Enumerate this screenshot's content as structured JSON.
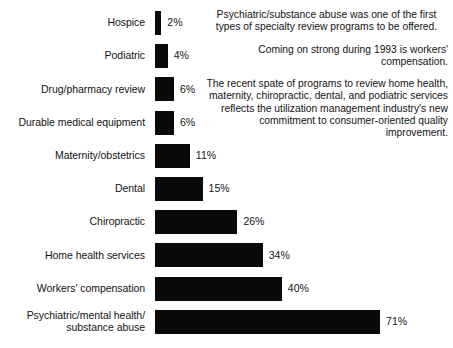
{
  "chart_data": {
    "type": "bar",
    "orientation": "horizontal",
    "title": "",
    "xlabel": "",
    "ylabel": "",
    "grid": false,
    "legend": false,
    "xlim": [
      0,
      71
    ],
    "value_suffix": "%",
    "bar_color": "#0a0a0a",
    "categories": [
      "Hospice",
      "Podiatric",
      "Drug/pharmacy review",
      "Durable medical equipment",
      "Maternity/obstetrics",
      "Dental",
      "Chiropractic",
      "Home health services",
      "Workers' compensation",
      "Psychiatric/mental health/\nsubstance abuse"
    ],
    "values": [
      2,
      4,
      6,
      6,
      11,
      15,
      26,
      34,
      40,
      71
    ],
    "value_labels": [
      "2%",
      "4%",
      "6%",
      "6%",
      "11%",
      "15%",
      "26%",
      "34%",
      "40%",
      "71%"
    ]
  },
  "notes": [
    {
      "id": "note-psychiatric-first",
      "align": "center",
      "text": "Psychiatric/substance abuse was one of the first types of specialty review programs to be offered."
    },
    {
      "id": "note-workers-comp",
      "align": "right",
      "text": "Coming on strong during 1993 is workers' compensation."
    },
    {
      "id": "note-recent-spate",
      "align": "right",
      "text": "The recent spate of programs to review home health, maternity, chiropractic, dental, and podiatric services reflects the utilization management industry's new commitment to consumer-oriented quality improvement."
    }
  ]
}
